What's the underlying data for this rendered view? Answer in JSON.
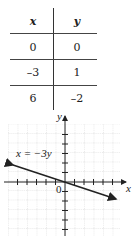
{
  "table": {
    "headers": [
      "x",
      "y"
    ],
    "rows": [
      {
        "x": "0",
        "y": "0"
      },
      {
        "x": "–3",
        "y": "1"
      },
      {
        "x": "6",
        "y": "–2"
      }
    ]
  },
  "graph": {
    "x_axis_label": "x",
    "y_axis_label": "y",
    "origin_label": "0",
    "equation_label": "x = −3y",
    "line_color": "#222222",
    "grid_color": "#bbbbbb"
  }
}
